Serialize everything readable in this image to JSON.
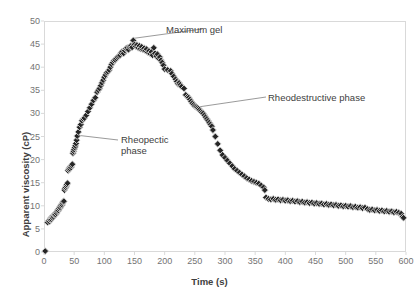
{
  "chart_data": {
    "type": "scatter",
    "title": "",
    "xlabel": "Time (s)",
    "ylabel": "Apparent viscosity (cP)",
    "xlim": [
      0,
      600
    ],
    "ylim": [
      0,
      50
    ],
    "xticks": [
      0,
      50,
      100,
      150,
      200,
      250,
      300,
      350,
      400,
      450,
      500,
      550,
      600
    ],
    "yticks": [
      0,
      5,
      10,
      15,
      20,
      25,
      30,
      35,
      40,
      45,
      50
    ],
    "grid": false,
    "legend": null,
    "marker": {
      "shape": "diamond",
      "fill": "#262626",
      "edge": "#d9d9d9",
      "size": 4
    },
    "annotations": [
      {
        "name": "maximum-gel",
        "text": "Maximum gel",
        "point": [
          148,
          45.8
        ],
        "label_xy": [
          205,
          47.5
        ]
      },
      {
        "name": "rheopectic-phase",
        "text": "Rheopectic\nphase",
        "point": [
          55,
          25.2
        ],
        "label_xy": [
          130,
          22.8
        ]
      },
      {
        "name": "rheodestructive-phase",
        "text": "Rheodestructive phase",
        "point": [
          245,
          31.5
        ],
        "label_xy": [
          372,
          33.2
        ]
      }
    ],
    "points": [
      [
        2,
        0.2
      ],
      [
        6,
        6.4
      ],
      [
        8,
        6.8
      ],
      [
        9,
        6.6
      ],
      [
        10,
        7.0
      ],
      [
        11,
        7.3
      ],
      [
        12,
        7.1
      ],
      [
        13,
        7.5
      ],
      [
        14,
        7.4
      ],
      [
        15,
        7.8
      ],
      [
        16,
        7.6
      ],
      [
        17,
        8.0
      ],
      [
        18,
        8.2
      ],
      [
        19,
        8.1
      ],
      [
        20,
        8.5
      ],
      [
        21,
        8.4
      ],
      [
        22,
        8.8
      ],
      [
        23,
        9.1
      ],
      [
        24,
        9.0
      ],
      [
        25,
        9.4
      ],
      [
        26,
        9.7
      ],
      [
        27,
        9.6
      ],
      [
        28,
        10.0
      ],
      [
        29,
        10.3
      ],
      [
        30,
        10.2
      ],
      [
        31,
        10.6
      ],
      [
        32,
        10.9
      ],
      [
        33,
        11.0
      ],
      [
        34,
        13.4
      ],
      [
        35,
        13.8
      ],
      [
        36,
        14.0
      ],
      [
        37,
        14.3
      ],
      [
        38,
        14.6
      ],
      [
        39,
        14.9
      ],
      [
        40,
        17.6
      ],
      [
        41,
        17.9
      ],
      [
        42,
        18.2
      ],
      [
        43,
        18.0
      ],
      [
        44,
        18.5
      ],
      [
        45,
        18.3
      ],
      [
        46,
        18.7
      ],
      [
        47,
        19.0
      ],
      [
        48,
        21.4
      ],
      [
        49,
        21.8
      ],
      [
        50,
        22.2
      ],
      [
        51,
        22.6
      ],
      [
        52,
        23.0
      ],
      [
        53,
        23.5
      ],
      [
        54,
        24.2
      ],
      [
        55,
        25.1
      ],
      [
        57,
        26.0
      ],
      [
        59,
        27.0
      ],
      [
        61,
        27.6
      ],
      [
        63,
        28.4
      ],
      [
        65,
        28.8
      ],
      [
        67,
        29.0
      ],
      [
        70,
        29.6
      ],
      [
        73,
        30.4
      ],
      [
        76,
        31.2
      ],
      [
        79,
        32.0
      ],
      [
        82,
        32.8
      ],
      [
        85,
        33.4
      ],
      [
        88,
        34.6
      ],
      [
        90,
        35.0
      ],
      [
        92,
        35.4
      ],
      [
        94,
        36.0
      ],
      [
        96,
        36.6
      ],
      [
        98,
        37.2
      ],
      [
        100,
        37.8
      ],
      [
        102,
        38.3
      ],
      [
        104,
        38.8
      ],
      [
        106,
        39.0
      ],
      [
        108,
        39.4
      ],
      [
        110,
        40.0
      ],
      [
        112,
        40.6
      ],
      [
        114,
        41.0
      ],
      [
        116,
        41.4
      ],
      [
        118,
        41.6
      ],
      [
        120,
        41.9
      ],
      [
        122,
        42.2
      ],
      [
        124,
        42.4
      ],
      [
        126,
        42.6
      ],
      [
        128,
        43.1
      ],
      [
        130,
        43.4
      ],
      [
        132,
        43.0
      ],
      [
        134,
        43.6
      ],
      [
        136,
        44.0
      ],
      [
        138,
        44.2
      ],
      [
        140,
        43.8
      ],
      [
        142,
        44.4
      ],
      [
        144,
        44.6
      ],
      [
        146,
        44.3
      ],
      [
        148,
        45.8
      ],
      [
        150,
        44.9
      ],
      [
        152,
        44.5
      ],
      [
        154,
        44.8
      ],
      [
        156,
        44.2
      ],
      [
        158,
        44.6
      ],
      [
        160,
        44.0
      ],
      [
        162,
        44.4
      ],
      [
        164,
        43.8
      ],
      [
        166,
        44.1
      ],
      [
        168,
        43.6
      ],
      [
        170,
        43.9
      ],
      [
        172,
        43.2
      ],
      [
        174,
        43.5
      ],
      [
        176,
        42.9
      ],
      [
        178,
        43.3
      ],
      [
        180,
        42.6
      ],
      [
        182,
        44.2
      ],
      [
        184,
        43.0
      ],
      [
        186,
        42.4
      ],
      [
        188,
        42.8
      ],
      [
        190,
        41.9
      ],
      [
        192,
        42.2
      ],
      [
        194,
        41.5
      ],
      [
        196,
        41.0
      ],
      [
        198,
        40.4
      ],
      [
        200,
        39.6
      ],
      [
        205,
        39.4
      ],
      [
        210,
        39.2
      ],
      [
        212,
        38.6
      ],
      [
        215,
        38.0
      ],
      [
        218,
        37.4
      ],
      [
        220,
        36.9
      ],
      [
        222,
        36.4
      ],
      [
        224,
        36.6
      ],
      [
        226,
        36.2
      ],
      [
        228,
        35.8
      ],
      [
        232,
        35.4
      ],
      [
        235,
        34.0
      ],
      [
        238,
        33.6
      ],
      [
        240,
        33.4
      ],
      [
        242,
        33.0
      ],
      [
        244,
        32.6
      ],
      [
        246,
        32.2
      ],
      [
        248,
        31.9
      ],
      [
        250,
        31.6
      ],
      [
        252,
        31.4
      ],
      [
        254,
        31.2
      ],
      [
        256,
        31.0
      ],
      [
        258,
        30.8
      ],
      [
        260,
        30.5
      ],
      [
        262,
        30.2
      ],
      [
        264,
        30.0
      ],
      [
        266,
        29.6
      ],
      [
        268,
        29.2
      ],
      [
        270,
        28.8
      ],
      [
        272,
        28.4
      ],
      [
        274,
        28.0
      ],
      [
        276,
        27.6
      ],
      [
        278,
        27.2
      ],
      [
        280,
        26.4
      ],
      [
        284,
        25.0
      ],
      [
        288,
        23.4
      ],
      [
        292,
        22.0
      ],
      [
        296,
        21.0
      ],
      [
        300,
        20.4
      ],
      [
        304,
        19.8
      ],
      [
        308,
        19.2
      ],
      [
        312,
        18.6
      ],
      [
        316,
        18.0
      ],
      [
        320,
        17.6
      ],
      [
        324,
        17.2
      ],
      [
        328,
        16.8
      ],
      [
        332,
        16.4
      ],
      [
        336,
        16.0
      ],
      [
        340,
        15.7
      ],
      [
        344,
        15.4
      ],
      [
        348,
        15.2
      ],
      [
        352,
        15.0
      ],
      [
        356,
        14.8
      ],
      [
        360,
        14.4
      ],
      [
        364,
        14.0
      ],
      [
        366,
        13.4
      ],
      [
        368,
        11.8
      ],
      [
        372,
        11.5
      ],
      [
        376,
        11.4
      ],
      [
        380,
        11.5
      ],
      [
        384,
        11.3
      ],
      [
        388,
        11.4
      ],
      [
        392,
        11.2
      ],
      [
        396,
        11.3
      ],
      [
        400,
        11.1
      ],
      [
        404,
        11.2
      ],
      [
        408,
        11.0
      ],
      [
        412,
        11.1
      ],
      [
        416,
        10.9
      ],
      [
        420,
        11.0
      ],
      [
        424,
        10.8
      ],
      [
        428,
        10.9
      ],
      [
        432,
        10.7
      ],
      [
        436,
        10.8
      ],
      [
        440,
        10.6
      ],
      [
        444,
        10.7
      ],
      [
        448,
        10.5
      ],
      [
        452,
        10.6
      ],
      [
        456,
        10.4
      ],
      [
        460,
        10.5
      ],
      [
        464,
        10.3
      ],
      [
        468,
        10.4
      ],
      [
        472,
        10.2
      ],
      [
        476,
        10.3
      ],
      [
        480,
        10.1
      ],
      [
        484,
        10.2
      ],
      [
        488,
        10.0
      ],
      [
        492,
        10.1
      ],
      [
        496,
        9.9
      ],
      [
        500,
        10.0
      ],
      [
        504,
        9.8
      ],
      [
        508,
        9.9
      ],
      [
        512,
        9.7
      ],
      [
        516,
        9.8
      ],
      [
        520,
        9.6
      ],
      [
        524,
        9.7
      ],
      [
        528,
        9.5
      ],
      [
        532,
        9.6
      ],
      [
        536,
        9.3
      ],
      [
        540,
        9.1
      ],
      [
        544,
        9.2
      ],
      [
        548,
        9.0
      ],
      [
        552,
        9.1
      ],
      [
        556,
        8.9
      ],
      [
        560,
        9.0
      ],
      [
        564,
        8.8
      ],
      [
        568,
        8.9
      ],
      [
        572,
        8.7
      ],
      [
        576,
        8.8
      ],
      [
        580,
        8.6
      ],
      [
        584,
        8.7
      ],
      [
        588,
        8.5
      ],
      [
        592,
        8.3
      ],
      [
        594,
        7.6
      ],
      [
        596,
        7.4
      ]
    ]
  }
}
